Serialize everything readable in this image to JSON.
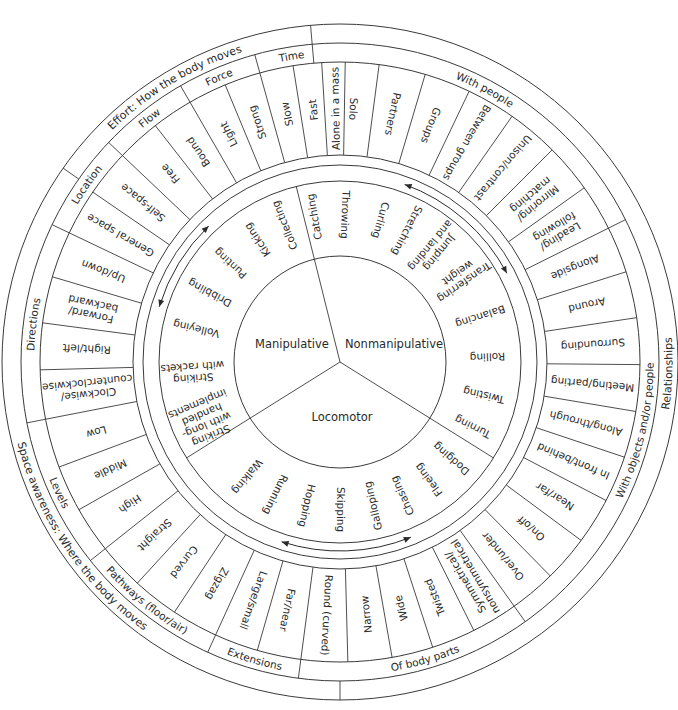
{
  "diagram": {
    "type": "movement-framework-wheel",
    "center": {
      "x": 340,
      "y": 362
    },
    "radii": {
      "outer": 338,
      "band1": 319,
      "band2": 300,
      "concepts_inner": 207,
      "arrow_outer": 197,
      "skills_outer": 181,
      "core": 106
    },
    "colors": {
      "line": "#3a3a3a",
      "text": "#2a2a2a",
      "background": "#ffffff"
    }
  },
  "core": {
    "categories": [
      {
        "label": "Manipulative",
        "from": -14,
        "to": 238
      },
      {
        "label": "Nonmanipulative",
        "from": 14,
        "to": 122
      },
      {
        "label": "Locomotor",
        "from": 122,
        "to": 238
      }
    ]
  },
  "skills": {
    "manipulative": [
      "Catching",
      "Collecting",
      "Kicking",
      "Punting",
      "Dribbling",
      "Volleying",
      "Striking with rackets",
      "Striking with long-handled implements",
      "Throwing"
    ],
    "nonmanipulative": [
      "Curling",
      "Stretching",
      "Jumping and landing",
      "Transferring weight",
      "Balancing",
      "Rolling",
      "Twisting",
      "Turning"
    ],
    "locomotor": [
      "Dodging",
      "Fleeing",
      "Chasing",
      "Galloping",
      "Skipping",
      "Hopping",
      "Running",
      "Walking"
    ]
  },
  "skill_ring": [
    {
      "label": "Throwing",
      "a": 2
    },
    {
      "label": "Curling",
      "a": 16
    },
    {
      "label": "Stretching",
      "a": 27
    },
    {
      "label": "Jumping and landing",
      "a": 40
    },
    {
      "label": "Transferring weight",
      "a": 55
    },
    {
      "label": "Balancing",
      "a": 72
    },
    {
      "label": "Rolling",
      "a": 88
    },
    {
      "label": "Twisting",
      "a": 103
    },
    {
      "label": "Turning",
      "a": 116
    },
    {
      "label": "Dodging",
      "a": 131
    },
    {
      "label": "Fleeing",
      "a": 143
    },
    {
      "label": "Chasing",
      "a": 155
    },
    {
      "label": "Galloping",
      "a": 167
    },
    {
      "label": "Skipping",
      "a": 180
    },
    {
      "label": "Hopping",
      "a": 193
    },
    {
      "label": "Running",
      "a": 206
    },
    {
      "label": "Walking",
      "a": 219
    },
    {
      "label": "Striking with long-handled implements",
      "a": 247
    },
    {
      "label": "Striking with rackets",
      "a": 266
    },
    {
      "label": "Volleying",
      "a": 283
    },
    {
      "label": "Dribbling",
      "a": 298
    },
    {
      "label": "Punting",
      "a": 312
    },
    {
      "label": "Kicking",
      "a": 326
    },
    {
      "label": "Collecting",
      "a": 338
    },
    {
      "label": "Catching",
      "a": 350
    }
  ],
  "concept_ring": {
    "cells": [
      {
        "label": "Solo",
        "a": 3,
        "group": "With people"
      },
      {
        "label": "Partners",
        "a": 12,
        "group": "With people"
      },
      {
        "label": "Groups",
        "a": 21,
        "group": "With people"
      },
      {
        "label": "Between groups",
        "a": 30,
        "group": "With people"
      },
      {
        "label": "Unison/contrast",
        "a": 40,
        "group": "With people"
      },
      {
        "label": "Mirroring/ matching",
        "a": 50,
        "group": "With people"
      },
      {
        "label": "Leading/ following",
        "a": 59,
        "group": "With people"
      },
      {
        "label": "Alongside",
        "a": 68,
        "group": "With objects and/or people"
      },
      {
        "label": "Around",
        "a": 77,
        "group": "With objects and/or people"
      },
      {
        "label": "Surrounding",
        "a": 86,
        "group": "With objects and/or people"
      },
      {
        "label": "Meeting/parting",
        "a": 95,
        "group": "With objects and/or people"
      },
      {
        "label": "Along/through",
        "a": 104,
        "group": "With objects and/or people"
      },
      {
        "label": "In front/behind",
        "a": 113,
        "group": "With objects and/or people"
      },
      {
        "label": "Near/far",
        "a": 122,
        "group": "With objects and/or people"
      },
      {
        "label": "On/off",
        "a": 131,
        "group": "With objects and/or people"
      },
      {
        "label": "Over/under",
        "a": 140,
        "group": "With objects and/or people"
      },
      {
        "label": "Symmetrical/ nonsymmetrical",
        "a": 149,
        "group": "Of body parts"
      },
      {
        "label": "Twisted",
        "a": 158,
        "group": "Of body parts"
      },
      {
        "label": "Wide",
        "a": 166,
        "group": "Of body parts"
      },
      {
        "label": "Narrow",
        "a": 174,
        "group": "Of body parts"
      },
      {
        "label": "Round (curved)",
        "a": 183,
        "group": "Of body parts"
      },
      {
        "label": "Far/near",
        "a": 192,
        "group": "Extensions"
      },
      {
        "label": "Large/small",
        "a": 200,
        "group": "Extensions"
      },
      {
        "label": "Zigzag",
        "a": 209,
        "group": "Pathways (floor/air)"
      },
      {
        "label": "Curved",
        "a": 218,
        "group": "Pathways (floor/air)"
      },
      {
        "label": "Straight",
        "a": 227,
        "group": "Pathways (floor/air)"
      },
      {
        "label": "High",
        "a": 236,
        "group": "Levels"
      },
      {
        "label": "Middle",
        "a": 245,
        "group": "Levels"
      },
      {
        "label": "Low",
        "a": 254,
        "group": "Levels"
      },
      {
        "label": "Clockwise/ counterclockwise",
        "a": 264,
        "group": "Directions"
      },
      {
        "label": "Right/left",
        "a": 273,
        "group": "Directions"
      },
      {
        "label": "Forward/ backward",
        "a": 282,
        "group": "Directions"
      },
      {
        "label": "Up/down",
        "a": 291,
        "group": "Directions"
      },
      {
        "label": "General space",
        "a": 300,
        "group": "Location"
      },
      {
        "label": "Self-space",
        "a": 309,
        "group": "Location"
      },
      {
        "label": "Free",
        "a": 318,
        "group": "Flow"
      },
      {
        "label": "Bound",
        "a": 326,
        "group": "Flow"
      },
      {
        "label": "Light",
        "a": 334,
        "group": "Force"
      },
      {
        "label": "Strong",
        "a": 341,
        "group": "Force"
      },
      {
        "label": "Slow",
        "a": 348,
        "group": "Time"
      },
      {
        "label": "Fast",
        "a": 354,
        "group": "Time"
      },
      {
        "label": "Alone in a mass",
        "a": 359,
        "group": "With people"
      }
    ]
  },
  "subgroups": [
    {
      "label": "With people",
      "a": 28,
      "flip": false
    },
    {
      "label": "With objects and/or people",
      "a": 103,
      "flip": true
    },
    {
      "label": "Of body parts",
      "a": 164,
      "flip": true
    },
    {
      "label": "Extensions",
      "a": 196,
      "flip": true
    },
    {
      "label": "Pathways (floor/air)",
      "a": 219,
      "flip": true
    },
    {
      "label": "Levels",
      "a": 245,
      "flip": true
    },
    {
      "label": "Directions",
      "a": 277,
      "flip": false
    },
    {
      "label": "Location",
      "a": 305,
      "flip": false
    },
    {
      "label": "Flow",
      "a": 322,
      "flip": false
    },
    {
      "label": "Force",
      "a": 337,
      "flip": false
    },
    {
      "label": "Time",
      "a": 351,
      "flip": false
    }
  ],
  "top_categories": [
    {
      "label": "Effort: How the body moves",
      "a": 329,
      "flip": false
    },
    {
      "label": "Relationships",
      "a": 92,
      "flip": true
    },
    {
      "label": "Space awareness: Where the body moves",
      "a": 236,
      "flip": true
    }
  ]
}
